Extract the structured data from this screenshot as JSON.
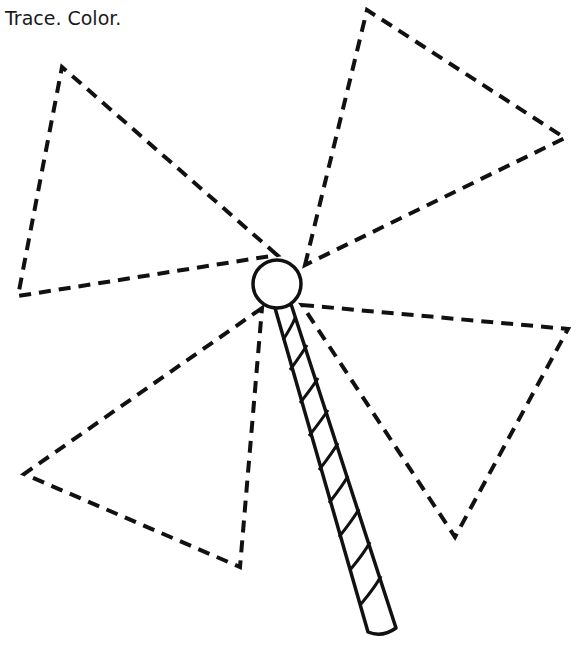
{
  "worksheet": {
    "instruction": "Trace. Color.",
    "subject": "pinwheel",
    "line_color": "#111111",
    "background_color": "#ffffff",
    "hub": {
      "cx": 277,
      "cy": 284,
      "r": 24
    },
    "blades": [
      {
        "name": "upper-left-blade",
        "points": [
          [
            277,
            255
          ],
          [
            62,
            67
          ],
          [
            18,
            296
          ]
        ]
      },
      {
        "name": "upper-right-blade",
        "points": [
          [
            305,
            265
          ],
          [
            367,
            10
          ],
          [
            565,
            138
          ]
        ]
      },
      {
        "name": "right-blade",
        "points": [
          [
            302,
            305
          ],
          [
            568,
            329
          ],
          [
            455,
            537
          ]
        ]
      },
      {
        "name": "lower-left-blade",
        "points": [
          [
            262,
            308
          ],
          [
            24,
            474
          ],
          [
            240,
            567
          ]
        ]
      }
    ],
    "stick": {
      "top_left": [
        275,
        310
      ],
      "top_right": [
        291,
        306
      ],
      "bottom_left": [
        367,
        633
      ],
      "bottom_right": [
        396,
        628
      ],
      "stripe_count": 9
    }
  }
}
